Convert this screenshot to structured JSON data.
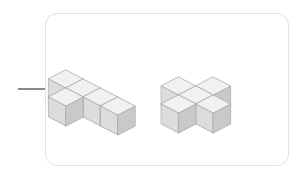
{
  "canvas": {
    "width": 304,
    "height": 177,
    "background": "#ffffff"
  },
  "panel": {
    "name": "rounded-panel",
    "x": 45,
    "y": 13,
    "width": 244,
    "height": 153,
    "border_radius": 12,
    "border_color": "#e2e2e2",
    "border_width": 1,
    "fill": "#ffffff"
  },
  "connector": {
    "name": "connector-line",
    "x": 18,
    "y": 88,
    "width": 28,
    "height": 2,
    "color": "#8a8a8a"
  },
  "palette": {
    "top_face": "#f1f1f1",
    "left_face": "#dcdcdc",
    "right_face": "#c9c9c9",
    "edge_stroke": "#a9a9a9",
    "edge_width": 0.8
  },
  "iso": {
    "cube_size": 20,
    "dx": 17.3,
    "dy": 9.0,
    "dz": 20.0
  },
  "shapes": [
    {
      "name": "shape-left-tee",
      "label": "left-cube-assembly",
      "origin": {
        "x": 66,
        "y": 70
      },
      "cube_count": 5,
      "description": "row of four cubes with one cube protruding toward viewer",
      "cells": [
        {
          "gx": 0,
          "gy": 0,
          "gz": 0
        },
        {
          "gx": 1,
          "gy": 0,
          "gz": 0
        },
        {
          "gx": 2,
          "gy": 0,
          "gz": 0
        },
        {
          "gx": 3,
          "gy": 0,
          "gz": 0
        },
        {
          "gx": 1,
          "gy": 1,
          "gz": 0
        }
      ]
    },
    {
      "name": "shape-right-plus",
      "label": "right-cube-assembly",
      "origin": {
        "x": 196,
        "y": 68
      },
      "cube_count": 5,
      "description": "plus / cross arrangement of five cubes",
      "cells": [
        {
          "gx": 1,
          "gy": 0,
          "gz": 0
        },
        {
          "gx": 0,
          "gy": 1,
          "gz": 0
        },
        {
          "gx": 1,
          "gy": 1,
          "gz": 0
        },
        {
          "gx": 2,
          "gy": 1,
          "gz": 0
        },
        {
          "gx": 1,
          "gy": 2,
          "gz": 0
        }
      ]
    }
  ]
}
